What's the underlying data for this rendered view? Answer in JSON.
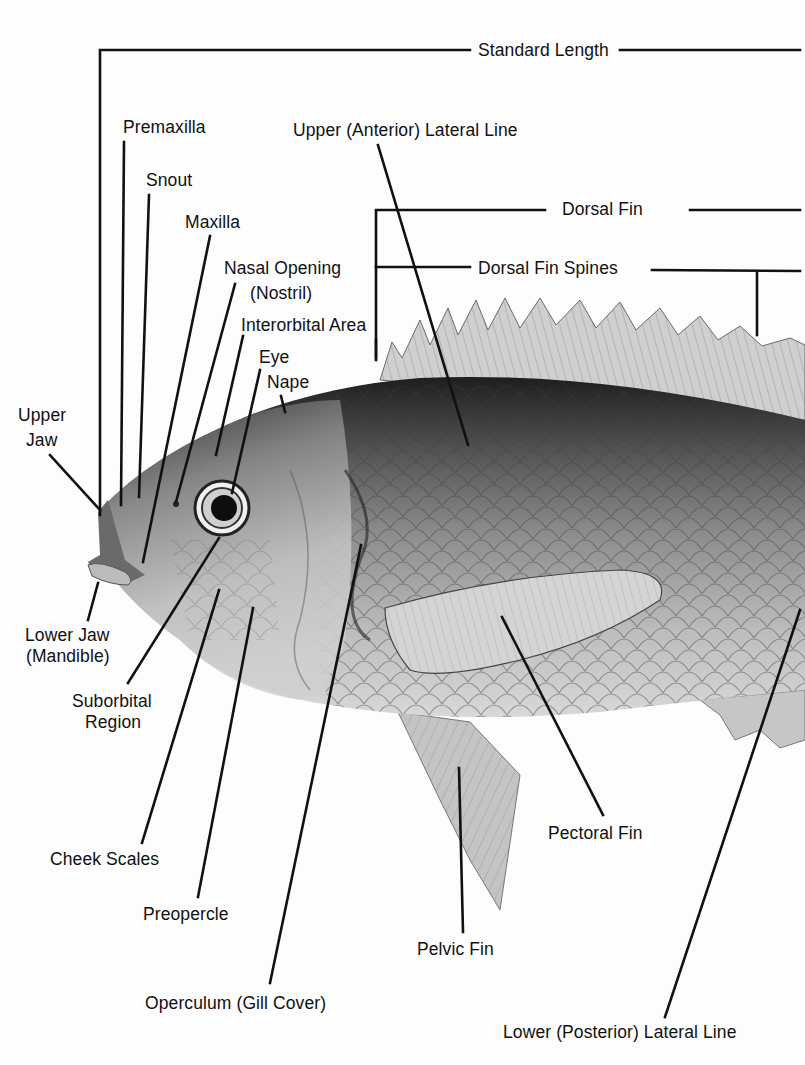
{
  "diagram": {
    "colors": {
      "background": "#fdfdfd",
      "line": "#111111",
      "fish_dark": "#3a3a3a",
      "fish_light": "#d6d6d6",
      "fin": "#c8c8c8"
    },
    "labels": {
      "standard_length": "Standard Length",
      "premaxilla": "Premaxilla",
      "upper_anterior_lateral_line": "Upper (Anterior) Lateral Line",
      "snout": "Snout",
      "maxilla": "Maxilla",
      "dorsal_fin": "Dorsal Fin",
      "nasal_opening": "Nasal Opening",
      "nostril": "(Nostril)",
      "dorsal_fin_spines": "Dorsal Fin Spines",
      "interorbital_area": "Interorbital Area",
      "eye": "Eye",
      "nape": "Nape",
      "upper_jaw_1": "Upper",
      "upper_jaw_2": "Jaw",
      "lower_jaw_1": "Lower Jaw",
      "lower_jaw_2": "(Mandible)",
      "suborbital_1": "Suborbital",
      "suborbital_2": "Region",
      "cheek_scales": "Cheek Scales",
      "preopercle": "Preopercle",
      "operculum": "Operculum (Gill Cover)",
      "pelvic_fin": "Pelvic Fin",
      "pectoral_fin": "Pectoral Fin",
      "lower_posterior_lateral_line": "Lower (Posterior) Lateral Line"
    }
  }
}
